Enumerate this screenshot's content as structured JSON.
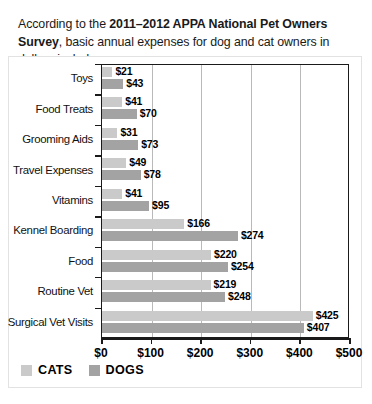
{
  "intro": {
    "before": "According to the ",
    "bold": "2011–2012 APPA National Pet Owners Survey",
    "after": ", basic annual expenses for dog and cat owners in dollars include:"
  },
  "legend": {
    "cats_label": "CATS",
    "dogs_label": "DOGS",
    "cats_color": "#cacaca",
    "dogs_color": "#a3a3a3"
  },
  "axis": {
    "ticks": [
      "$0",
      "$100",
      "$200",
      "$300",
      "$400",
      "$500"
    ]
  },
  "chart_data": {
    "type": "bar",
    "orientation": "horizontal",
    "title": "",
    "xlabel": "",
    "ylabel": "",
    "xlim": [
      0,
      500
    ],
    "grid": true,
    "legend_position": "bottom-left",
    "categories": [
      "Toys",
      "Food Treats",
      "Grooming Aids",
      "Travel Expenses",
      "Vitamins",
      "Kennel Boarding",
      "Food",
      "Routine Vet",
      "Surgical Vet Visits"
    ],
    "series": [
      {
        "name": "CATS",
        "color": "#cacaca",
        "values": [
          21,
          41,
          31,
          49,
          41,
          166,
          220,
          219,
          425
        ],
        "labels": [
          "$21",
          "$41",
          "$31",
          "$49",
          "$41",
          "$166",
          "$220",
          "$219",
          "$425"
        ]
      },
      {
        "name": "DOGS",
        "color": "#a3a3a3",
        "values": [
          43,
          70,
          73,
          78,
          95,
          274,
          254,
          248,
          407
        ],
        "labels": [
          "$43",
          "$70",
          "$73",
          "$78",
          "$95",
          "$274",
          "$254",
          "$248",
          "$407"
        ]
      }
    ]
  }
}
